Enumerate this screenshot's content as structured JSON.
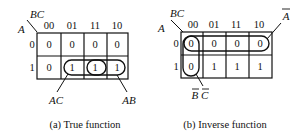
{
  "maps": [
    {
      "id": "true-function",
      "caption": "(a) True function",
      "row_var": "A",
      "col_var": "BC",
      "col_headers": [
        "00",
        "01",
        "11",
        "10"
      ],
      "row_headers": [
        "0",
        "1"
      ],
      "cells": [
        [
          "0",
          "0",
          "0",
          "0"
        ],
        [
          "0",
          "1",
          "1",
          "1"
        ]
      ],
      "groups": [
        {
          "label": "AC",
          "cells": "A=1, BC=01,11"
        },
        {
          "label": "AB",
          "cells": "A=1, BC=11,10"
        }
      ]
    },
    {
      "id": "inverse-function",
      "caption": "(b) Inverse function",
      "row_var": "A",
      "col_var": "BC",
      "col_headers": [
        "00",
        "01",
        "11",
        "10"
      ],
      "row_headers": [
        "0",
        "1"
      ],
      "cells": [
        [
          "0",
          "0",
          "0",
          "0"
        ],
        [
          "0",
          "1",
          "1",
          "1"
        ]
      ],
      "groups": [
        {
          "label": "A",
          "overbar": true,
          "cells": "A=0, all BC"
        },
        {
          "label": "B C",
          "overbar": true,
          "cells": "BC=00, A=0,1"
        }
      ]
    }
  ]
}
